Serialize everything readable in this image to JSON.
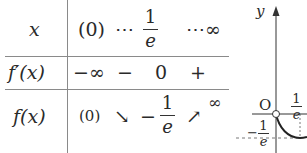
{
  "variation_table": {
    "rows": [
      {
        "label": "x",
        "cells": [
          "(0)",
          "⋯",
          "1/e",
          "⋯∞"
        ],
        "start": "(0)",
        "dots1": "⋯",
        "crit_num": "1",
        "crit_den": "e",
        "dots2": "⋯∞"
      },
      {
        "label": "f′(x)",
        "cells": [
          "−∞",
          "−",
          "0",
          "+"
        ],
        "c1": "−∞",
        "c2": "−",
        "c3": "0",
        "c4": "+"
      },
      {
        "label": "f(x)",
        "cells": [
          "(0)",
          "↘",
          "−1/e",
          "↗",
          "∞"
        ],
        "start": "(0)",
        "arrow_down": "↘",
        "min_sign": "−",
        "min_num": "1",
        "min_den": "e",
        "arrow_up": "↗",
        "end": "∞"
      }
    ]
  },
  "graph": {
    "y_axis_label": "y",
    "origin_label": "O",
    "x_mark_num": "1",
    "x_mark_den": "e",
    "y_mark_sign": "−",
    "y_mark_num": "1",
    "y_mark_den": "e"
  }
}
